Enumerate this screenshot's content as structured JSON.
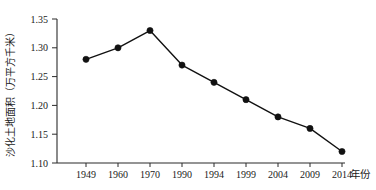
{
  "chart_data": {
    "type": "line",
    "title": "",
    "subtitle": "",
    "xlabel": "年份",
    "ylabel": "沙化土地面积（万平方千米）",
    "categories": [
      "1949",
      "1960",
      "1970",
      "1990",
      "1994",
      "1999",
      "2004",
      "2009",
      "2014"
    ],
    "values": [
      1.28,
      1.3,
      1.33,
      1.27,
      1.24,
      1.21,
      1.18,
      1.16,
      1.12
    ],
    "series": [
      {
        "name": "沙化土地面积",
        "values": [
          1.28,
          1.3,
          1.33,
          1.27,
          1.24,
          1.21,
          1.18,
          1.16,
          1.12
        ]
      }
    ],
    "ylim": [
      1.1,
      1.35
    ],
    "yticks": [
      1.1,
      1.15,
      1.2,
      1.25,
      1.3,
      1.35
    ],
    "ytick_labels": [
      "1.10",
      "1.15",
      "1.20",
      "1.25",
      "1.30",
      "1.35"
    ],
    "xtick_labels": [
      "1949",
      "1960",
      "1970",
      "1990",
      "1994",
      "1999",
      "2004",
      "2009",
      "2014"
    ],
    "grid": false,
    "legend": false,
    "legend_position": "none",
    "marker": "filled-circle",
    "line_color": "#111111",
    "marker_color": "#111111",
    "axis_color": "#2b2b2b",
    "background_color": "#ffffff",
    "annotations": []
  }
}
